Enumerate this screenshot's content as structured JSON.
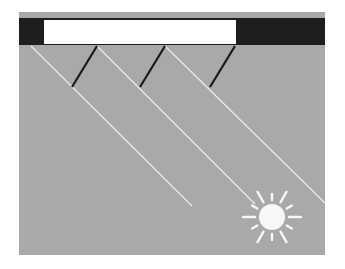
{
  "diagram": {
    "colors": {
      "background": "#ffffff",
      "sky": "#a9a9a9",
      "roof": "#1e1e1e",
      "overhang": "#ffffff",
      "ray": "#ececec",
      "shadow_line": "#1a1a1a",
      "sun": "#f7f7f7"
    },
    "panel": {
      "x": 19,
      "y": 12,
      "w": 306,
      "h": 243
    },
    "roof": {
      "x": 19,
      "y": 18,
      "w": 306,
      "h": 27
    },
    "overhang": {
      "x": 44,
      "y": 20,
      "w": 192,
      "h": 24
    },
    "sun_rays": [
      {
        "x1": 31,
        "y1": 46,
        "x2": 192,
        "y2": 206
      },
      {
        "x1": 97,
        "y1": 46,
        "x2": 255,
        "y2": 204
      },
      {
        "x1": 165,
        "y1": 46,
        "x2": 325,
        "y2": 203
      }
    ],
    "shadow_lines": [
      {
        "x1": 97,
        "y1": 46,
        "x2": 72,
        "y2": 87
      },
      {
        "x1": 165,
        "y1": 46,
        "x2": 140,
        "y2": 87
      },
      {
        "x1": 235,
        "y1": 46,
        "x2": 210,
        "y2": 87
      }
    ],
    "sun": {
      "cx": 272,
      "cy": 217,
      "r": 13
    },
    "icons": {
      "sun": "sun-icon"
    }
  }
}
